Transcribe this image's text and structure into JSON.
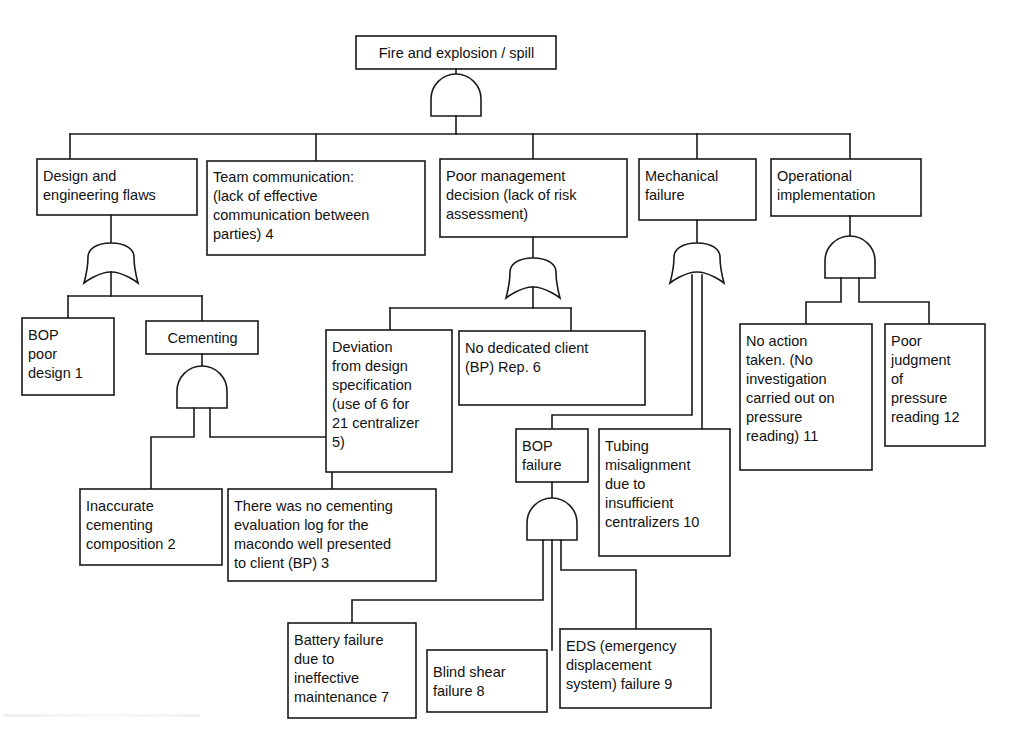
{
  "diagram": {
    "type": "fault-tree",
    "line_color": "#1a1a1a",
    "box_fill": "#ffffff",
    "background": "#ffffff"
  },
  "nodes": [
    {
      "id": "top",
      "label": "Fire and explosion / spill",
      "gate": "and",
      "x": 356,
      "y": 36,
      "w": 200,
      "h": 33
    },
    {
      "id": "design",
      "label": "Design and\nengineering flaws",
      "gate": "or",
      "x": 37,
      "y": 159,
      "w": 160,
      "h": 56
    },
    {
      "id": "teamcomm",
      "label": "Team communication:\n(lack of effective\ncommunication between\nparties) 4",
      "gate": "none",
      "x": 207,
      "y": 161,
      "w": 218,
      "h": 94
    },
    {
      "id": "poormgmt",
      "label": "Poor management\ndecision (lack of risk\nassessment)",
      "gate": "or",
      "x": 440,
      "y": 159,
      "w": 187,
      "h": 78
    },
    {
      "id": "mechfail",
      "label": "Mechanical\nfailure",
      "gate": "or",
      "x": 639,
      "y": 159,
      "w": 117,
      "h": 61
    },
    {
      "id": "opimpl",
      "label": "Operational\nimplementation",
      "gate": "and",
      "x": 771,
      "y": 159,
      "w": 150,
      "h": 57
    },
    {
      "id": "bopdesign",
      "label": "BOP\npoor\ndesign 1",
      "gate": "none",
      "x": 22,
      "y": 318,
      "w": 92,
      "h": 77
    },
    {
      "id": "cementing",
      "label": "Cementing",
      "gate": "and",
      "x": 146,
      "y": 321,
      "w": 112,
      "h": 33
    },
    {
      "id": "inaccurate",
      "label": "Inaccurate\ncementing\ncomposition 2",
      "gate": "none",
      "x": 80,
      "y": 489,
      "w": 142,
      "h": 76
    },
    {
      "id": "nolog",
      "label": "There was no cementing\nevaluation log for the\nmacondo well presented\nto client (BP) 3",
      "gate": "none",
      "x": 228,
      "y": 489,
      "w": 208,
      "h": 92
    },
    {
      "id": "deviation",
      "label": "Deviation\nfrom design\nspecification\n(use of 6 for\n21 centralizer\n5)",
      "gate": "none",
      "x": 326,
      "y": 330,
      "w": 126,
      "h": 142
    },
    {
      "id": "norep",
      "label": "No dedicated client\n(BP) Rep. 6",
      "gate": "none",
      "x": 459,
      "y": 331,
      "w": 186,
      "h": 74
    },
    {
      "id": "bopfailure",
      "label": "BOP\nfailure",
      "gate": "and",
      "x": 516,
      "y": 429,
      "w": 72,
      "h": 53
    },
    {
      "id": "tubing",
      "label": "Tubing\nmisalignment\ndue to\ninsufficient\ncentralizers 10",
      "gate": "none",
      "x": 599,
      "y": 429,
      "w": 131,
      "h": 127
    },
    {
      "id": "battery",
      "label": "Battery failure\ndue to\nineffective\nmaintenance 7",
      "gate": "none",
      "x": 288,
      "y": 623,
      "w": 128,
      "h": 95
    },
    {
      "id": "blindshear",
      "label": "Blind shear\nfailure 8",
      "gate": "none",
      "x": 427,
      "y": 650,
      "w": 120,
      "h": 62
    },
    {
      "id": "eds",
      "label": "EDS (emergency\ndisplacement\nsystem) failure 9",
      "gate": "none",
      "x": 560,
      "y": 629,
      "w": 151,
      "h": 79
    },
    {
      "id": "noaction",
      "label": "No action\ntaken. (No\ninvestigation\ncarried out on\npressure\nreading) 11",
      "gate": "none",
      "x": 740,
      "y": 324,
      "w": 132,
      "h": 146
    },
    {
      "id": "poorjudge",
      "label": "Poor\njudgment\nof\npressure\nreading 12",
      "gate": "none",
      "x": 885,
      "y": 324,
      "w": 100,
      "h": 122
    }
  ],
  "gates": [
    {
      "id": "g-top",
      "type": "and",
      "label": "AND",
      "parent": "top",
      "children": [
        "design",
        "teamcomm",
        "poormgmt",
        "mechfail",
        "opimpl"
      ]
    },
    {
      "id": "g-des",
      "type": "or",
      "label": "OR",
      "parent": "design",
      "children": [
        "bopdesign",
        "cementing"
      ]
    },
    {
      "id": "g-cem",
      "type": "and",
      "label": "AND",
      "parent": "cementing",
      "children": [
        "inaccurate",
        "nolog"
      ]
    },
    {
      "id": "g-mgmt",
      "type": "or",
      "label": "OR",
      "parent": "poormgmt",
      "children": [
        "deviation",
        "norep"
      ]
    },
    {
      "id": "g-mech",
      "type": "or",
      "label": "OR",
      "parent": "mechfail",
      "children": [
        "bopfailure",
        "tubing"
      ]
    },
    {
      "id": "g-op",
      "type": "and",
      "label": "AND",
      "parent": "opimpl",
      "children": [
        "noaction",
        "poorjudge"
      ]
    },
    {
      "id": "g-bop",
      "type": "and",
      "label": "AND",
      "parent": "bopfailure",
      "children": [
        "battery",
        "blindshear",
        "eds"
      ]
    }
  ]
}
